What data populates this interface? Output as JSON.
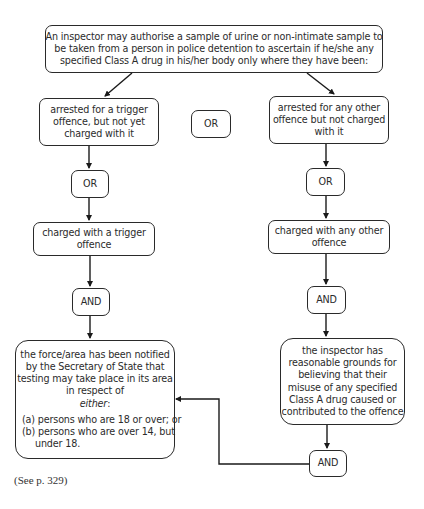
{
  "diagram": {
    "top": {
      "lines": [
        "An inspector may authorise a sample of urine or non-intimate sample to",
        "be taken from a person in police detention to ascertain if he/she any",
        "specified Class A drug in his/her body only where they have been:"
      ]
    },
    "left_branch": {
      "arrested": {
        "lines": [
          "arrested for a trigger",
          "offence, but not yet",
          "charged with it"
        ]
      },
      "or_label": "OR",
      "charged": {
        "lines": [
          "charged with a trigger",
          "offence"
        ]
      },
      "and_label": "AND",
      "condition": {
        "lines": [
          "the force/area has been notified",
          "by the Secretary of State that",
          "testing may take place in its area",
          "in respect of"
        ],
        "emphasis": "either",
        "emphasis_suffix": ":",
        "options": [
          "(a) persons who are 18 or over; or",
          "(b) persons who are over 14, but",
          "under 18."
        ]
      }
    },
    "middle_or_label": "OR",
    "right_branch": {
      "arrested": {
        "lines": [
          "arrested for any other",
          "offence but not charged",
          "with it"
        ]
      },
      "or_label": "OR",
      "charged": {
        "lines": [
          "charged with any other",
          "offence"
        ]
      },
      "and_label": "AND",
      "condition": {
        "lines": [
          "the inspector has",
          "reasonable grounds for",
          "believing that their",
          "misuse of any specified",
          "Class A drug caused or",
          "contributed to the offence"
        ]
      },
      "final_and_label": "AND"
    }
  },
  "footer": {
    "reference": "(See p. 329)"
  }
}
